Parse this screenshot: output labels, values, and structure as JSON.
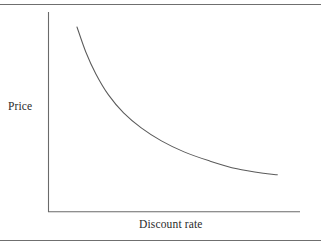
{
  "figure": {
    "background_color": "#ffffff",
    "line_color": "#5a5a5a",
    "rule_color": "#6f6f6f",
    "text_color": "#2b2b2b",
    "top_rule_label": "top-horizontal-rule",
    "bottom_rule_label": "bottom-horizontal-rule"
  },
  "chart_data": {
    "type": "line",
    "title": "",
    "subtitle": "",
    "xlabel": "Discount rate",
    "ylabel": "Price",
    "legend": [],
    "legend_position": "none",
    "grid": false,
    "xticks": [],
    "yticks": [],
    "xtick_labels": [],
    "ytick_labels": [],
    "xlim": [
      0,
      1
    ],
    "ylim": [
      0,
      1
    ],
    "annotations": [],
    "series": [
      {
        "name": "Price vs discount rate",
        "description": "Convex decreasing hyperbolic curve: price falls steeply as the discount rate rises, then flattens toward an asymptote.",
        "x": [
          0.115,
          0.15,
          0.19,
          0.24,
          0.3,
          0.37,
          0.45,
          0.54,
          0.64,
          0.75,
          0.87,
          0.91
        ],
        "y": [
          0.925,
          0.8,
          0.69,
          0.585,
          0.495,
          0.42,
          0.355,
          0.3,
          0.255,
          0.215,
          0.19,
          0.185
        ]
      }
    ]
  },
  "axes": {
    "y_axis_name": "vertical-axis-line",
    "x_axis_name": "horizontal-axis-line",
    "curve_name": "price-discount-curve"
  },
  "labels": {
    "y": "Price",
    "x": "Discount rate"
  }
}
